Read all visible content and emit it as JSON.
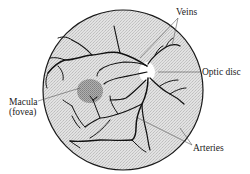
{
  "diagram": {
    "labels": {
      "veins": "Veins",
      "optic_disc": "Optic disc",
      "macula_line1": "Macula",
      "macula_line2": "(fovea)",
      "arteries": "Arteries"
    },
    "colors": {
      "retina_fill": "#d9d9d9",
      "outline": "#1a1a1a",
      "vessel": "#111111",
      "macula": "#9a9a9a",
      "optic_disc": "#ffffff",
      "leader_line": "#555555"
    }
  }
}
